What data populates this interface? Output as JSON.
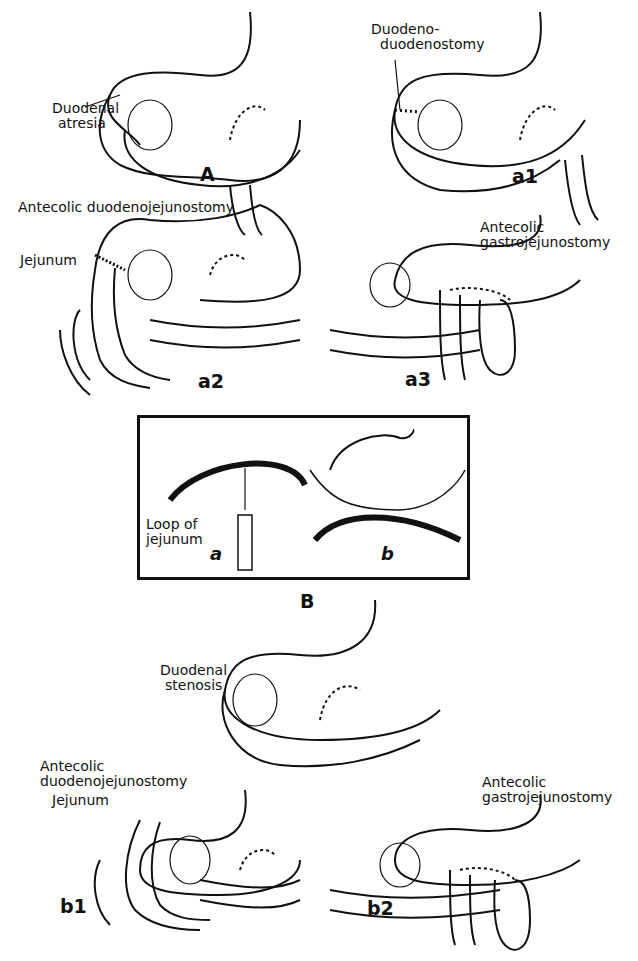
{
  "header": {
    "partial_text": "Plate 102"
  },
  "panels": {
    "A": {
      "letter": "A",
      "labels": [
        "Duodenal",
        "atresia"
      ]
    },
    "a1": {
      "letter": "a1",
      "labels": [
        "Duodeno-",
        "duodenostomy"
      ]
    },
    "a2": {
      "letter": "a2",
      "labels": [
        "Antecolic duodenojejunostomy",
        "Jejunum"
      ]
    },
    "a3": {
      "letter": "a3",
      "labels": [
        "Antecolic",
        "gastrojejunostomy"
      ]
    },
    "B": {
      "letter": "B",
      "inset_a": {
        "letter": "a",
        "labels": [
          "Loop of",
          "jejunum"
        ]
      },
      "inset_b": {
        "letter": "b"
      }
    },
    "stenosis": {
      "labels": [
        "Duodenal",
        "stenosis"
      ]
    },
    "b1": {
      "letter": "b1",
      "labels": [
        "Antecolic",
        "duodenojejunostomy",
        "Jejunum"
      ]
    },
    "b2": {
      "letter": "b2",
      "labels": [
        "Antecolic",
        "gastrojejunostomy"
      ]
    }
  }
}
